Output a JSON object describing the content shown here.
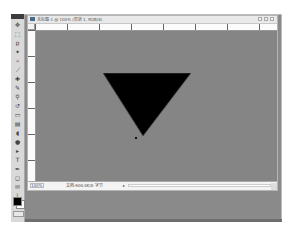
{
  "app": "Photoshop",
  "toolbox": {
    "tools": [
      {
        "name": "move-tool-icon",
        "glyph": "✥"
      },
      {
        "name": "marquee-tool-icon",
        "glyph": "⬚"
      },
      {
        "name": "lasso-tool-icon",
        "glyph": "ϱ"
      },
      {
        "name": "magic-wand-tool-icon",
        "glyph": "✦"
      },
      {
        "name": "crop-tool-icon",
        "glyph": "⌗"
      },
      {
        "name": "slice-tool-icon",
        "glyph": "⟋"
      },
      {
        "name": "healing-brush-tool-icon",
        "glyph": "✚"
      },
      {
        "name": "brush-tool-icon",
        "glyph": "✎"
      },
      {
        "name": "clone-stamp-tool-icon",
        "glyph": "⚲"
      },
      {
        "name": "history-brush-tool-icon",
        "glyph": "↺"
      },
      {
        "name": "eraser-tool-icon",
        "glyph": "▭"
      },
      {
        "name": "gradient-tool-icon",
        "glyph": "▤"
      },
      {
        "name": "blur-tool-icon",
        "glyph": "◖"
      },
      {
        "name": "dodge-tool-icon",
        "glyph": "●"
      },
      {
        "name": "path-selection-tool-icon",
        "glyph": "▸"
      },
      {
        "name": "type-tool-icon",
        "glyph": "T"
      },
      {
        "name": "pen-tool-icon",
        "glyph": "✒"
      },
      {
        "name": "shape-tool-icon",
        "glyph": "◻"
      },
      {
        "name": "notes-tool-icon",
        "glyph": "✉"
      },
      {
        "name": "eyedropper-tool-icon",
        "glyph": "⌇"
      },
      {
        "name": "hand-tool-icon",
        "glyph": "✋"
      },
      {
        "name": "zoom-tool-icon",
        "glyph": "⚲"
      }
    ],
    "foreground_color": "#000000",
    "background_color": "#ffffff"
  },
  "document": {
    "title": "未标题-1 @ 100% (形状 1, RGB/8)",
    "window_buttons": [
      "minimize",
      "maximize",
      "close"
    ],
    "ruler_labels": [
      "0",
      "50",
      "100",
      "150",
      "200",
      "250",
      "300"
    ],
    "canvas_color": "#858585",
    "shape": {
      "type": "inverted-triangle",
      "fill": "#000000",
      "points": [
        [
          0,
          0
        ],
        [
          87,
          0
        ],
        [
          39,
          62
        ]
      ]
    },
    "status": {
      "zoom": "100%",
      "doc_info": "文档:900.0K/0 字节"
    }
  }
}
